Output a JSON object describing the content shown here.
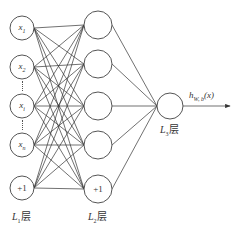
{
  "diagram": {
    "type": "neural-network",
    "layers": [
      {
        "name": "L1",
        "label_main": "L",
        "label_sub": "1",
        "label_suffix": "层",
        "nodes": [
          {
            "main": "x",
            "sub": "1"
          },
          {
            "main": "x",
            "sub": "2"
          },
          {
            "main": "x",
            "sub": "i"
          },
          {
            "main": "x",
            "sub": "n"
          },
          {
            "main": "+1",
            "sub": ""
          }
        ]
      },
      {
        "name": "L2",
        "label_main": "L",
        "label_sub": "2",
        "label_suffix": "层",
        "nodes": [
          {
            "main": "",
            "sub": ""
          },
          {
            "main": "",
            "sub": ""
          },
          {
            "main": "",
            "sub": ""
          },
          {
            "main": "",
            "sub": ""
          },
          {
            "main": "+1",
            "sub": ""
          }
        ]
      },
      {
        "name": "L3",
        "label_main": "L",
        "label_sub": "3",
        "label_suffix": "层",
        "nodes": [
          {
            "main": "",
            "sub": ""
          }
        ]
      }
    ],
    "output": {
      "main": "h",
      "sub": "W, b",
      "arg": "(x)"
    },
    "colors": {
      "stroke": "#555555",
      "edge": "#333333",
      "background": "#ffffff"
    }
  }
}
